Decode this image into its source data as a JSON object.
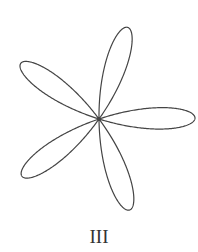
{
  "figure": {
    "type": "rose_curve",
    "petals": 5,
    "center": [
      99,
      119
    ],
    "radius": 96,
    "rotation_deg": 0.6,
    "stroke_color": "#444444",
    "stroke_width": 1.2
  },
  "caption": "III"
}
